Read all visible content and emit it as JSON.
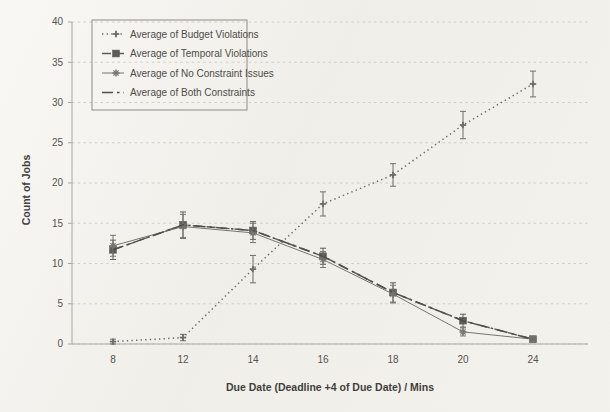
{
  "chart_data": {
    "type": "line",
    "title": "",
    "xlabel": "Due Date (Deadline +4 of Due Date)  /  Mins",
    "ylabel": "Count of Jobs",
    "categories": [
      "8",
      "12",
      "14",
      "16",
      "18",
      "20",
      "24"
    ],
    "ylim": [
      0,
      40
    ],
    "ytick_labels": [
      "0",
      "5",
      "10",
      "15",
      "20",
      "25",
      "30",
      "35",
      "40"
    ],
    "ytick_values": [
      0,
      5,
      10,
      15,
      20,
      25,
      30,
      35,
      40
    ],
    "grid": true,
    "legend_position": "upper-left",
    "series": [
      {
        "name": "Average of Budget Violations",
        "line_style": "dotted",
        "marker": "cross",
        "color": "#6e6d69",
        "values": [
          0.3,
          0.8,
          9.3,
          17.4,
          21.0,
          27.2,
          32.3
        ],
        "errors": [
          0.3,
          0.4,
          1.7,
          1.5,
          1.4,
          1.7,
          1.6
        ]
      },
      {
        "name": "Average of Temporal Violations",
        "line_style": "dashed",
        "marker": "square",
        "color": "#5d5c58",
        "values": [
          11.7,
          14.8,
          14.1,
          10.9,
          6.4,
          2.9,
          0.6
        ],
        "errors": [
          1.2,
          1.6,
          1.1,
          1.0,
          1.2,
          0.8,
          0.3
        ]
      },
      {
        "name": "Average of No Constraint Issues",
        "line_style": "solid",
        "marker": "star",
        "color": "#76756f",
        "values": [
          12.2,
          14.6,
          13.8,
          10.5,
          6.2,
          1.5,
          0.6
        ],
        "errors": [
          1.3,
          1.5,
          1.2,
          1.0,
          1.1,
          0.5,
          0.3
        ]
      },
      {
        "name": "Average of Both Constraints",
        "line_style": "dash-dot",
        "marker": "none",
        "color": "#4f4e4a",
        "values": [
          11.7,
          14.8,
          14.1,
          10.9,
          6.4,
          2.9,
          0.6
        ],
        "errors": [
          0,
          0,
          0,
          0,
          0,
          0,
          0
        ]
      }
    ]
  },
  "legend": {
    "items": [
      {
        "label": "Average of Budget Violations"
      },
      {
        "label": "Average of Temporal Violations"
      },
      {
        "label": "Average of No Constraint Issues"
      },
      {
        "label": "Average of Both Constraints"
      }
    ]
  },
  "axes": {
    "x_title": "Due Date (Deadline +4 of Due Date)  /  Mins",
    "y_title": "Count of Jobs"
  }
}
